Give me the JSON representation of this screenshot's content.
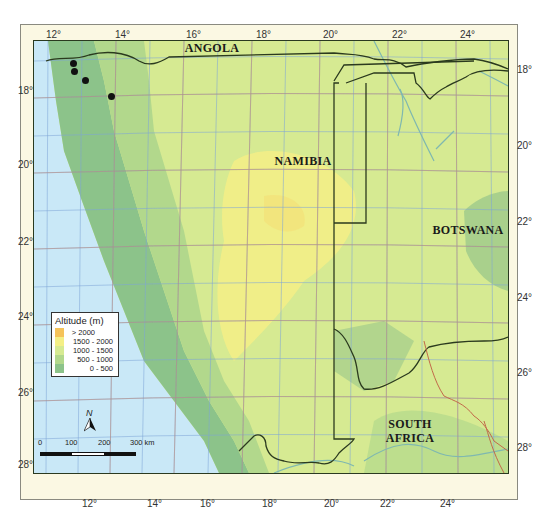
{
  "map": {
    "countries": [
      {
        "name": "ANGOLA"
      },
      {
        "name": "NAMIBIA"
      },
      {
        "name": "BOTSWANA"
      },
      {
        "name": "SOUTH AFRICA",
        "lines": [
          "SOUTH",
          "AFRICA"
        ]
      }
    ],
    "longitude_ticks_top": [
      "12°",
      "14°",
      "16°",
      "18°",
      "20°",
      "22°",
      "24°"
    ],
    "longitude_ticks_bottom": [
      "12°",
      "14°",
      "16°",
      "18°",
      "20°",
      "22°",
      "24°"
    ],
    "latitude_ticks_left": [
      "18°",
      "20°",
      "22°",
      "24°",
      "26°",
      "28°"
    ],
    "latitude_ticks_right": [
      "18°",
      "20°",
      "22°",
      "24°",
      "26°",
      "28°"
    ],
    "legend": {
      "title": "Altitude (m)",
      "items": [
        {
          "label": "> 2000",
          "color": "#f5c35a"
        },
        {
          "label": "1500 - 2000",
          "color": "#f4ef86"
        },
        {
          "label": "1000 - 1500",
          "color": "#d6ea92"
        },
        {
          "label": "500 - 1000",
          "color": "#b2d88c"
        },
        {
          "label": "0 - 500",
          "color": "#8cc38a"
        }
      ]
    },
    "scale_bar": {
      "labels": [
        "0",
        "100",
        "200",
        "300 km"
      ]
    },
    "north_arrow": {
      "label": "N"
    },
    "sample_points": [
      {
        "x": 73,
        "y": 63
      },
      {
        "x": 74,
        "y": 72
      },
      {
        "x": 85,
        "y": 81
      },
      {
        "x": 111,
        "y": 97
      }
    ],
    "colors": {
      "ocean": "#c9e8f7",
      "coast_lowland": "#8cc38a",
      "plateau": "#d6ea92",
      "highland": "#f4ef86",
      "border": "#2b3a1e",
      "river": "#7fb8b0",
      "grid_blue": "#7fa6d8",
      "grid_dark": "#5e7a4a",
      "grid_red": "#c9856a"
    }
  }
}
